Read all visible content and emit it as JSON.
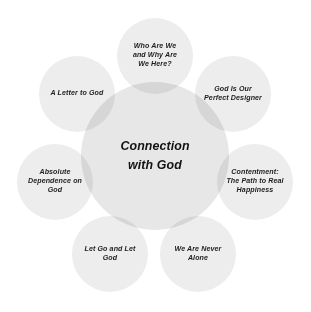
{
  "diagram": {
    "type": "radial-cluster-venn",
    "title": "Connection with God",
    "background_color": "#ffffff",
    "center": {
      "label": "Connection\nwith God",
      "line1": "Connection",
      "line2": "with God",
      "cx": 155,
      "cy": 156,
      "r": 74,
      "fill": "#e7e7e7",
      "text_color": "#131313"
    },
    "satellite_style": {
      "r": 38,
      "orbit_r": 118,
      "fill": "#ededed",
      "text_color": "#1d1d1d"
    },
    "overlap_fill": "#d8d8d8",
    "satellites": [
      {
        "id": "who-are-we",
        "label": "Who Are We\nand Why Are\nWe Here?",
        "angle_deg": -90,
        "cx": 155,
        "cy": 56
      },
      {
        "id": "perfect-designer",
        "label": "God Is Our\nPerfect Designer",
        "angle_deg": -38.6,
        "cx": 233,
        "cy": 94
      },
      {
        "id": "contentment",
        "label": "Contentment:\nThe Path to Real\nHappiness",
        "angle_deg": 12.9,
        "cx": 255,
        "cy": 182
      },
      {
        "id": "never-alone",
        "label": "We Are Never\nAlone",
        "angle_deg": 64.3,
        "cx": 198,
        "cy": 254
      },
      {
        "id": "let-go",
        "label": "Let Go and Let\nGod",
        "angle_deg": 115.7,
        "cx": 110,
        "cy": 254
      },
      {
        "id": "absolute-dependence",
        "label": "Absolute\nDependence on\nGod",
        "angle_deg": 167.1,
        "cx": 55,
        "cy": 182
      },
      {
        "id": "letter-to-god",
        "label": "A Letter to God",
        "angle_deg": -141.4,
        "cx": 77,
        "cy": 94
      }
    ]
  }
}
